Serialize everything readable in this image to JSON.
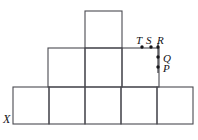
{
  "figure": {
    "background_color": "#ffffff",
    "stroke_color": "#4a4a50",
    "dot_color": "#17171b",
    "label_color": "#111115",
    "canvas": {
      "width": 198,
      "height": 140
    },
    "rows": [
      {
        "name": "top-row",
        "count": 1,
        "x": 85,
        "y": 11,
        "cell_width": 37,
        "cell_height": 37
      },
      {
        "name": "middle-row",
        "count": 3,
        "x": 48,
        "y": 48,
        "cell_width": 37,
        "cell_height": 39
      },
      {
        "name": "bottom-row",
        "count": 5,
        "x": 13,
        "y": 87,
        "cell_width": 36,
        "cell_height": 37
      }
    ],
    "points": [
      {
        "id": "T",
        "label": "T",
        "cx": 142,
        "cy": 47,
        "label_x": 136,
        "label_y": 35
      },
      {
        "id": "S",
        "label": "S",
        "cx": 151,
        "cy": 47,
        "label_x": 146,
        "label_y": 35
      },
      {
        "id": "R",
        "label": "R",
        "cx": 158,
        "cy": 47,
        "label_x": 157,
        "label_y": 35
      },
      {
        "id": "Q",
        "label": "Q",
        "cx": 158,
        "cy": 57,
        "label_x": 163,
        "label_y": 53
      },
      {
        "id": "P",
        "label": "P",
        "cx": 158,
        "cy": 67,
        "label_x": 163,
        "label_y": 63
      }
    ],
    "corner_label": {
      "id": "X",
      "label": "X",
      "x": 3,
      "y": 113
    }
  }
}
